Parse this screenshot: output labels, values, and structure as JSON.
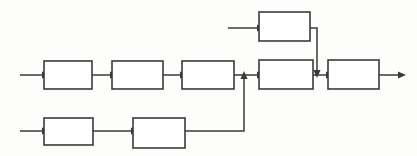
{
  "diagram": {
    "type": "block-flow-diagram",
    "title": "",
    "canvas": {
      "width": 417,
      "height": 156
    },
    "style": {
      "background_color": "#fdfdfb",
      "line_color": "#3a3a3a",
      "box_fill_color": "#ffffff",
      "box_stroke_width": 1.6,
      "line_stroke_width": 1.5
    },
    "blocks": [
      {
        "id": "top-1",
        "label": "",
        "x": 259,
        "y": 12,
        "w": 51,
        "h": 29,
        "row": "top"
      },
      {
        "id": "middle-1",
        "label": "",
        "x": 44,
        "y": 61,
        "w": 48,
        "h": 28,
        "row": "middle"
      },
      {
        "id": "middle-2",
        "label": "",
        "x": 112,
        "y": 61,
        "w": 51,
        "h": 28,
        "row": "middle"
      },
      {
        "id": "middle-3",
        "label": "",
        "x": 182,
        "y": 61,
        "w": 52,
        "h": 28,
        "row": "middle"
      },
      {
        "id": "middle-4",
        "label": "",
        "x": 259,
        "y": 60,
        "w": 54,
        "h": 29,
        "row": "middle"
      },
      {
        "id": "middle-5",
        "label": "",
        "x": 328,
        "y": 60,
        "w": 51,
        "h": 29,
        "row": "middle"
      },
      {
        "id": "bottom-1",
        "label": "",
        "x": 44,
        "y": 118,
        "w": 49,
        "h": 27,
        "row": "bottom"
      },
      {
        "id": "bottom-2",
        "label": "",
        "x": 133,
        "y": 118,
        "w": 52,
        "h": 30,
        "row": "bottom"
      }
    ],
    "connectors": [
      {
        "id": "input-top",
        "kind": "arrow",
        "path": "M 228 28 L 257 28",
        "arrow_at": "end",
        "arrow_dir": "right"
      },
      {
        "id": "input-middle",
        "kind": "arrow",
        "path": "M 20 75 L 42 75",
        "arrow_at": "end",
        "arrow_dir": "right"
      },
      {
        "id": "input-bottom",
        "kind": "arrow",
        "path": "M 20 131 L 42 131",
        "arrow_at": "end",
        "arrow_dir": "right"
      },
      {
        "id": "m1-to-m2",
        "kind": "arrow",
        "path": "M 92 75 L 110 75",
        "arrow_at": "end",
        "arrow_dir": "right"
      },
      {
        "id": "m2-to-m3",
        "kind": "arrow",
        "path": "M 163 75 L 180 75",
        "arrow_at": "end",
        "arrow_dir": "right"
      },
      {
        "id": "m3-to-m4",
        "kind": "arrow",
        "path": "M 234 75 L 257 75",
        "arrow_at": "end",
        "arrow_dir": "right"
      },
      {
        "id": "m4-to-m5",
        "kind": "arrow",
        "path": "M 313 75 L 326 75",
        "arrow_at": "end",
        "arrow_dir": "right"
      },
      {
        "id": "m5-output",
        "kind": "arrow",
        "path": "M 379 75 L 398 75",
        "arrow_at": "end",
        "arrow_dir": "right"
      },
      {
        "id": "b1-to-b2",
        "kind": "arrow",
        "path": "M 93 131 L 131 131",
        "arrow_at": "end",
        "arrow_dir": "right"
      },
      {
        "id": "b2-feedback-up",
        "kind": "arrow",
        "path": "M 185 131 L 244 131 L 244 79",
        "arrow_at": "end",
        "arrow_dir": "up"
      },
      {
        "id": "top-feed-down",
        "kind": "arrow",
        "path": "M 310 28 L 317 28 L 317 70",
        "arrow_at": "end",
        "arrow_dir": "down"
      }
    ]
  }
}
